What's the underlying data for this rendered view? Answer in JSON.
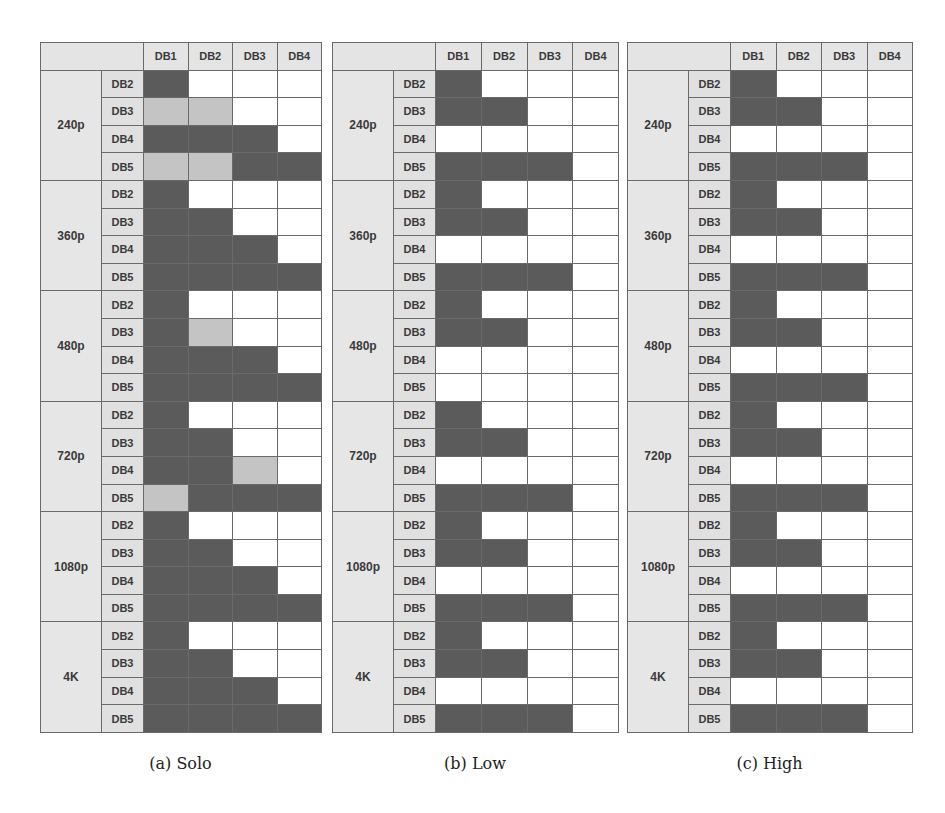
{
  "legend": {
    "dark": "#5b5b5b",
    "light": "#c4c4c4",
    "white": "#ffffff",
    "header_bg": "#e4e4e4"
  },
  "columns": [
    "DB1",
    "DB2",
    "DB3",
    "DB4"
  ],
  "row_labels": [
    "DB2",
    "DB3",
    "DB4",
    "DB5"
  ],
  "resolutions": [
    "240p",
    "360p",
    "480p",
    "720p",
    "1080p",
    "4K"
  ],
  "panels": [
    {
      "caption": "(a) Solo",
      "cells": {
        "240p": [
          [
            2,
            0,
            0,
            0
          ],
          [
            1,
            1,
            0,
            0
          ],
          [
            2,
            2,
            2,
            0
          ],
          [
            1,
            1,
            2,
            2
          ]
        ],
        "360p": [
          [
            2,
            0,
            0,
            0
          ],
          [
            2,
            2,
            0,
            0
          ],
          [
            2,
            2,
            2,
            0
          ],
          [
            2,
            2,
            2,
            2
          ]
        ],
        "480p": [
          [
            2,
            0,
            0,
            0
          ],
          [
            2,
            1,
            0,
            0
          ],
          [
            2,
            2,
            2,
            0
          ],
          [
            2,
            2,
            2,
            2
          ]
        ],
        "720p": [
          [
            2,
            0,
            0,
            0
          ],
          [
            2,
            2,
            0,
            0
          ],
          [
            2,
            2,
            1,
            0
          ],
          [
            1,
            2,
            2,
            2
          ]
        ],
        "1080p": [
          [
            2,
            0,
            0,
            0
          ],
          [
            2,
            2,
            0,
            0
          ],
          [
            2,
            2,
            2,
            0
          ],
          [
            2,
            2,
            2,
            2
          ]
        ],
        "4K": [
          [
            2,
            0,
            0,
            0
          ],
          [
            2,
            2,
            0,
            0
          ],
          [
            2,
            2,
            2,
            0
          ],
          [
            2,
            2,
            2,
            2
          ]
        ]
      }
    },
    {
      "caption": "(b) Low",
      "cells": {
        "240p": [
          [
            2,
            0,
            0,
            0
          ],
          [
            2,
            2,
            0,
            0
          ],
          [
            0,
            0,
            0,
            0
          ],
          [
            2,
            2,
            2,
            0
          ]
        ],
        "360p": [
          [
            2,
            0,
            0,
            0
          ],
          [
            2,
            2,
            0,
            0
          ],
          [
            0,
            0,
            0,
            0
          ],
          [
            2,
            2,
            2,
            0
          ]
        ],
        "480p": [
          [
            2,
            0,
            0,
            0
          ],
          [
            2,
            2,
            0,
            0
          ],
          [
            0,
            0,
            0,
            0
          ],
          [
            0,
            0,
            0,
            0
          ]
        ],
        "720p": [
          [
            2,
            0,
            0,
            0
          ],
          [
            2,
            2,
            0,
            0
          ],
          [
            0,
            0,
            0,
            0
          ],
          [
            2,
            2,
            2,
            0
          ]
        ],
        "1080p": [
          [
            2,
            0,
            0,
            0
          ],
          [
            2,
            2,
            0,
            0
          ],
          [
            0,
            0,
            0,
            0
          ],
          [
            2,
            2,
            2,
            0
          ]
        ],
        "4K": [
          [
            2,
            0,
            0,
            0
          ],
          [
            2,
            2,
            0,
            0
          ],
          [
            0,
            0,
            0,
            0
          ],
          [
            2,
            2,
            2,
            0
          ]
        ]
      }
    },
    {
      "caption": "(c) High",
      "cells": {
        "240p": [
          [
            2,
            0,
            0,
            0
          ],
          [
            2,
            2,
            0,
            0
          ],
          [
            0,
            0,
            0,
            0
          ],
          [
            2,
            2,
            2,
            0
          ]
        ],
        "360p": [
          [
            2,
            0,
            0,
            0
          ],
          [
            2,
            2,
            0,
            0
          ],
          [
            0,
            0,
            0,
            0
          ],
          [
            2,
            2,
            2,
            0
          ]
        ],
        "480p": [
          [
            2,
            0,
            0,
            0
          ],
          [
            2,
            2,
            0,
            0
          ],
          [
            0,
            0,
            0,
            0
          ],
          [
            2,
            2,
            2,
            0
          ]
        ],
        "720p": [
          [
            2,
            0,
            0,
            0
          ],
          [
            2,
            2,
            0,
            0
          ],
          [
            0,
            0,
            0,
            0
          ],
          [
            2,
            2,
            2,
            0
          ]
        ],
        "1080p": [
          [
            2,
            0,
            0,
            0
          ],
          [
            2,
            2,
            0,
            0
          ],
          [
            0,
            0,
            0,
            0
          ],
          [
            2,
            2,
            2,
            0
          ]
        ],
        "4K": [
          [
            2,
            0,
            0,
            0
          ],
          [
            2,
            2,
            0,
            0
          ],
          [
            0,
            0,
            0,
            0
          ],
          [
            2,
            2,
            2,
            0
          ]
        ]
      }
    }
  ],
  "chart_data": [
    {
      "type": "heatmap",
      "title": "(a) Solo",
      "x_categories": [
        "DB1",
        "DB2",
        "DB3",
        "DB4"
      ],
      "y_groups": [
        "240p",
        "360p",
        "480p",
        "720p",
        "1080p",
        "4K"
      ],
      "y_categories": [
        "DB2",
        "DB3",
        "DB4",
        "DB5"
      ],
      "value_key": {
        "0": "white",
        "1": "light gray",
        "2": "dark gray"
      },
      "values": {
        "240p": [
          [
            2,
            0,
            0,
            0
          ],
          [
            1,
            1,
            0,
            0
          ],
          [
            2,
            2,
            2,
            0
          ],
          [
            1,
            1,
            2,
            2
          ]
        ],
        "360p": [
          [
            2,
            0,
            0,
            0
          ],
          [
            2,
            2,
            0,
            0
          ],
          [
            2,
            2,
            2,
            0
          ],
          [
            2,
            2,
            2,
            2
          ]
        ],
        "480p": [
          [
            2,
            0,
            0,
            0
          ],
          [
            2,
            1,
            0,
            0
          ],
          [
            2,
            2,
            2,
            0
          ],
          [
            2,
            2,
            2,
            2
          ]
        ],
        "720p": [
          [
            2,
            0,
            0,
            0
          ],
          [
            2,
            2,
            0,
            0
          ],
          [
            2,
            2,
            1,
            0
          ],
          [
            1,
            2,
            2,
            2
          ]
        ],
        "1080p": [
          [
            2,
            0,
            0,
            0
          ],
          [
            2,
            2,
            0,
            0
          ],
          [
            2,
            2,
            2,
            0
          ],
          [
            2,
            2,
            2,
            2
          ]
        ],
        "4K": [
          [
            2,
            0,
            0,
            0
          ],
          [
            2,
            2,
            0,
            0
          ],
          [
            2,
            2,
            2,
            0
          ],
          [
            2,
            2,
            2,
            2
          ]
        ]
      }
    },
    {
      "type": "heatmap",
      "title": "(b) Low",
      "x_categories": [
        "DB1",
        "DB2",
        "DB3",
        "DB4"
      ],
      "y_groups": [
        "240p",
        "360p",
        "480p",
        "720p",
        "1080p",
        "4K"
      ],
      "y_categories": [
        "DB2",
        "DB3",
        "DB4",
        "DB5"
      ],
      "value_key": {
        "0": "white",
        "1": "light gray",
        "2": "dark gray"
      },
      "values": {
        "240p": [
          [
            2,
            0,
            0,
            0
          ],
          [
            2,
            2,
            0,
            0
          ],
          [
            0,
            0,
            0,
            0
          ],
          [
            2,
            2,
            2,
            0
          ]
        ],
        "360p": [
          [
            2,
            0,
            0,
            0
          ],
          [
            2,
            2,
            0,
            0
          ],
          [
            0,
            0,
            0,
            0
          ],
          [
            2,
            2,
            2,
            0
          ]
        ],
        "480p": [
          [
            2,
            0,
            0,
            0
          ],
          [
            2,
            2,
            0,
            0
          ],
          [
            0,
            0,
            0,
            0
          ],
          [
            0,
            0,
            0,
            0
          ]
        ],
        "720p": [
          [
            2,
            0,
            0,
            0
          ],
          [
            2,
            2,
            0,
            0
          ],
          [
            0,
            0,
            0,
            0
          ],
          [
            2,
            2,
            2,
            0
          ]
        ],
        "1080p": [
          [
            2,
            0,
            0,
            0
          ],
          [
            2,
            2,
            0,
            0
          ],
          [
            0,
            0,
            0,
            0
          ],
          [
            2,
            2,
            2,
            0
          ]
        ],
        "4K": [
          [
            2,
            0,
            0,
            0
          ],
          [
            2,
            2,
            0,
            0
          ],
          [
            0,
            0,
            0,
            0
          ],
          [
            2,
            2,
            2,
            0
          ]
        ]
      }
    },
    {
      "type": "heatmap",
      "title": "(c) High",
      "x_categories": [
        "DB1",
        "DB2",
        "DB3",
        "DB4"
      ],
      "y_groups": [
        "240p",
        "360p",
        "480p",
        "720p",
        "1080p",
        "4K"
      ],
      "y_categories": [
        "DB2",
        "DB3",
        "DB4",
        "DB5"
      ],
      "value_key": {
        "0": "white",
        "1": "light gray",
        "2": "dark gray"
      },
      "values": {
        "240p": [
          [
            2,
            0,
            0,
            0
          ],
          [
            2,
            2,
            0,
            0
          ],
          [
            0,
            0,
            0,
            0
          ],
          [
            2,
            2,
            2,
            0
          ]
        ],
        "360p": [
          [
            2,
            0,
            0,
            0
          ],
          [
            2,
            2,
            0,
            0
          ],
          [
            0,
            0,
            0,
            0
          ],
          [
            2,
            2,
            2,
            0
          ]
        ],
        "480p": [
          [
            2,
            0,
            0,
            0
          ],
          [
            2,
            2,
            0,
            0
          ],
          [
            0,
            0,
            0,
            0
          ],
          [
            2,
            2,
            2,
            0
          ]
        ],
        "720p": [
          [
            2,
            0,
            0,
            0
          ],
          [
            2,
            2,
            0,
            0
          ],
          [
            0,
            0,
            0,
            0
          ],
          [
            2,
            2,
            2,
            0
          ]
        ],
        "1080p": [
          [
            2,
            0,
            0,
            0
          ],
          [
            2,
            2,
            0,
            0
          ],
          [
            0,
            0,
            0,
            0
          ],
          [
            2,
            2,
            2,
            0
          ]
        ],
        "4K": [
          [
            2,
            0,
            0,
            0
          ],
          [
            2,
            2,
            0,
            0
          ],
          [
            0,
            0,
            0,
            0
          ],
          [
            2,
            2,
            2,
            0
          ]
        ]
      }
    }
  ]
}
